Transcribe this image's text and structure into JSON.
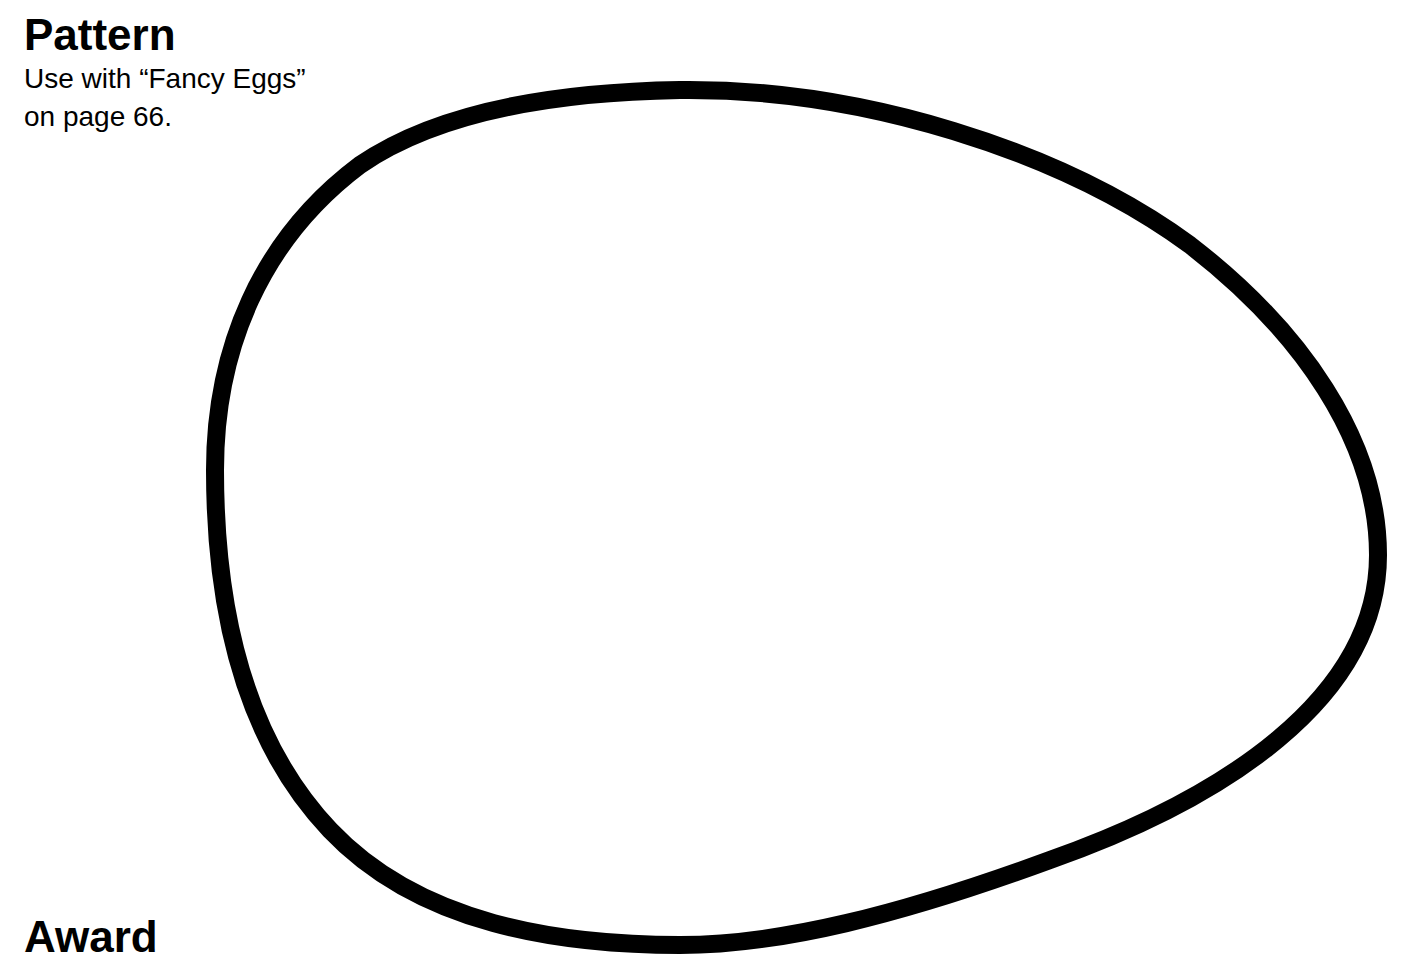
{
  "page": {
    "title": "Pattern",
    "subtitle_line1": "Use with “Fancy Eggs”",
    "subtitle_line2": "on page 66.",
    "footer_heading": "Award"
  },
  "shape": {
    "name": "egg-outline",
    "stroke_color": "#000000",
    "fill_color": "#ffffff",
    "stroke_width": 18
  }
}
